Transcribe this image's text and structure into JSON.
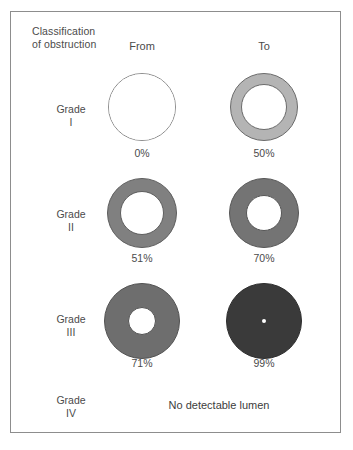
{
  "figure": {
    "title": "Classification\nof obstruction",
    "title_line1": "Classification",
    "title_line2": "of obstruction",
    "columns": {
      "from_label": "From",
      "to_label": "To"
    },
    "colors": {
      "outline": "#8d8d8d",
      "text": "#4b4b4b",
      "ring_light": "#b4b4b4",
      "ring_medium": "#808080",
      "ring_dark": "#6e6e6e",
      "ring_darkest": "#3a3a3a",
      "lumen_white": "#ffffff",
      "frame_border": "#8d8d8d"
    },
    "rows": [
      {
        "grade_word": "Grade",
        "grade_numeral": "I",
        "from": {
          "percent_label": "0%",
          "percent_value": 0,
          "outer_diameter_px": 68,
          "lumen_diameter_px": 66,
          "ring_fill": "#ffffff",
          "ring_stroke": "#8d8d8d"
        },
        "to": {
          "percent_label": "50%",
          "percent_value": 50,
          "outer_diameter_px": 68,
          "lumen_diameter_px": 46,
          "ring_fill": "#b4b4b4",
          "ring_stroke": "#6b6b6b"
        }
      },
      {
        "grade_word": "Grade",
        "grade_numeral": "II",
        "from": {
          "percent_label": "51%",
          "percent_value": 51,
          "outer_diameter_px": 70,
          "lumen_diameter_px": 44,
          "ring_fill": "#808080",
          "ring_stroke": "#5e5e5e"
        },
        "to": {
          "percent_label": "70%",
          "percent_value": 70,
          "outer_diameter_px": 70,
          "lumen_diameter_px": 36,
          "ring_fill": "#747474",
          "ring_stroke": "#565656"
        }
      },
      {
        "grade_word": "Grade",
        "grade_numeral": "III",
        "from": {
          "percent_label": "71%",
          "percent_value": 71,
          "outer_diameter_px": 76,
          "lumen_diameter_px": 28,
          "ring_fill": "#6e6e6e",
          "ring_stroke": "#525252"
        },
        "to": {
          "percent_label": "99%",
          "percent_value": 99,
          "outer_diameter_px": 76,
          "lumen_diameter_px": 4,
          "ring_fill": "#3a3a3a",
          "ring_stroke": "#2e2e2e"
        }
      },
      {
        "grade_word": "Grade",
        "grade_numeral": "IV",
        "no_lumen_text": "No detectable lumen"
      }
    ]
  }
}
